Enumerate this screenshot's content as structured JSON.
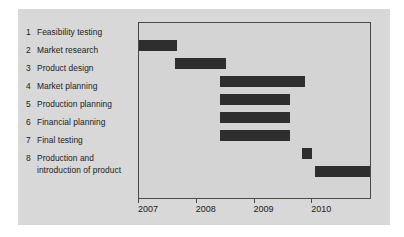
{
  "chart_data": {
    "type": "bar",
    "orientation": "horizontal",
    "subtype": "gantt",
    "title": "",
    "xlabel": "",
    "ylabel": "",
    "grid": false,
    "legend": null,
    "xlim": [
      2007.0,
      2011.0
    ],
    "xticks": [
      2007,
      2008,
      2009,
      2010
    ],
    "xtick_labels": [
      "2007",
      "2008",
      "2009",
      "2010"
    ],
    "bar_color": "#2e2e2e",
    "plot_background": "#d4d4d4",
    "figure_background": "#d8d8d8",
    "categories": [
      "Feasibility testing",
      "Market research",
      "Product design",
      "Market planning",
      "Production planning",
      "Financial planning",
      "Final testing",
      "Production and introduction of product"
    ],
    "tasks": [
      {
        "number": "1",
        "label": "Feasibility testing",
        "start": 2007.0,
        "end": 2007.65
      },
      {
        "number": "2",
        "label": "Market research",
        "start": 2007.62,
        "end": 2008.5
      },
      {
        "number": "3",
        "label": "Product design",
        "start": 2008.4,
        "end": 2009.88
      },
      {
        "number": "4",
        "label": "Market planning",
        "start": 2008.4,
        "end": 2009.62
      },
      {
        "number": "5",
        "label": "Production planning",
        "start": 2008.4,
        "end": 2009.62
      },
      {
        "number": "6",
        "label": "Financial planning",
        "start": 2008.4,
        "end": 2009.62
      },
      {
        "number": "7",
        "label": "Final testing",
        "start": 2009.82,
        "end": 2010.0
      },
      {
        "number": "8",
        "label": "Production and introduction of product",
        "start": 2010.05,
        "end": 2011.0
      }
    ]
  },
  "tasks": [
    {
      "number": "1",
      "label": "Feasibility testing"
    },
    {
      "number": "2",
      "label": "Market research"
    },
    {
      "number": "3",
      "label": "Product design"
    },
    {
      "number": "4",
      "label": "Market planning"
    },
    {
      "number": "5",
      "label": "Production planning"
    },
    {
      "number": "6",
      "label": "Financial planning"
    },
    {
      "number": "7",
      "label": "Final testing"
    },
    {
      "number": "8",
      "label": "Production and introduction of product"
    }
  ]
}
